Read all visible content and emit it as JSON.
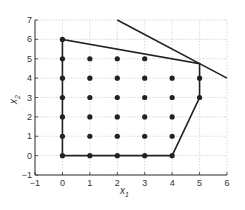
{
  "chart_data": {
    "type": "scatter",
    "title": "",
    "xlabel": "x",
    "xlabel_sub": "1",
    "ylabel": "x",
    "ylabel_sub": "2",
    "xlim": [
      -1,
      6
    ],
    "ylim": [
      -1,
      7
    ],
    "xticks": [
      -1,
      0,
      1,
      2,
      3,
      4,
      5,
      6
    ],
    "yticks": [
      -1,
      0,
      1,
      2,
      3,
      4,
      5,
      6,
      7
    ],
    "grid": true,
    "legend": null,
    "integer_points": [
      [
        0,
        0
      ],
      [
        1,
        0
      ],
      [
        2,
        0
      ],
      [
        3,
        0
      ],
      [
        4,
        0
      ],
      [
        0,
        1
      ],
      [
        1,
        1
      ],
      [
        2,
        1
      ],
      [
        3,
        1
      ],
      [
        4,
        1
      ],
      [
        0,
        2
      ],
      [
        1,
        2
      ],
      [
        2,
        2
      ],
      [
        3,
        2
      ],
      [
        4,
        2
      ],
      [
        0,
        3
      ],
      [
        1,
        3
      ],
      [
        2,
        3
      ],
      [
        3,
        3
      ],
      [
        4,
        3
      ],
      [
        5,
        3
      ],
      [
        0,
        4
      ],
      [
        1,
        4
      ],
      [
        2,
        4
      ],
      [
        3,
        4
      ],
      [
        4,
        4
      ],
      [
        5,
        4
      ],
      [
        0,
        5
      ],
      [
        1,
        5
      ],
      [
        2,
        5
      ],
      [
        3,
        5
      ],
      [
        0,
        6
      ]
    ],
    "polygon": [
      [
        0,
        0
      ],
      [
        0,
        6
      ],
      [
        5,
        4.75
      ],
      [
        5,
        3
      ],
      [
        4,
        0
      ],
      [
        0,
        0
      ]
    ],
    "lines": [
      {
        "name": "steep-constraint",
        "points": [
          [
            2,
            7
          ],
          [
            6,
            4
          ]
        ]
      }
    ],
    "colors": {
      "line": "#222222",
      "point": "#222222",
      "grid": "#c8c8c8",
      "axis": "#333333"
    }
  }
}
